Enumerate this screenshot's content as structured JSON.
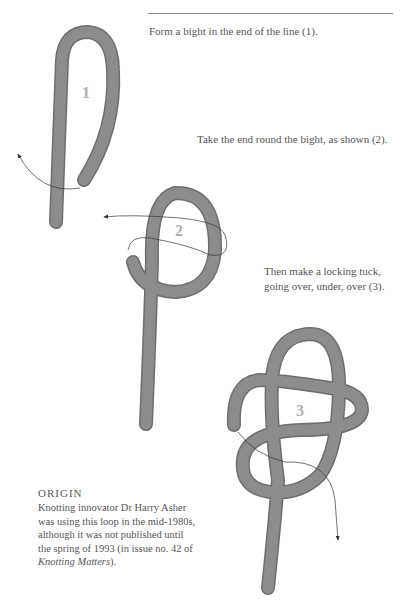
{
  "captions": {
    "step1": "Form a bight in the end of the line (1).",
    "step2": "Take the end round the bight, as shown (2).",
    "step3_line1": "Then make a locking tuck,",
    "step3_line2": "going over, under, over (3)."
  },
  "figures": {
    "step1_label": "1",
    "step2_label": "2",
    "step3_label": "3"
  },
  "origin": {
    "title": "ORIGIN",
    "body_line1": "Knotting innovator Dr Harry Asher",
    "body_line2": "was using this loop in the mid-1980s,",
    "body_line3": "although it was not published until",
    "body_line4": "the spring of 1993 (in issue no. 42 of",
    "publication": "Knotting Matters",
    "body_end": ")."
  },
  "colors": {
    "rope": "#8c8c8c",
    "rope_edge": "#6e6e6e",
    "label": "#b0b0b0",
    "arrow": "#333333"
  }
}
